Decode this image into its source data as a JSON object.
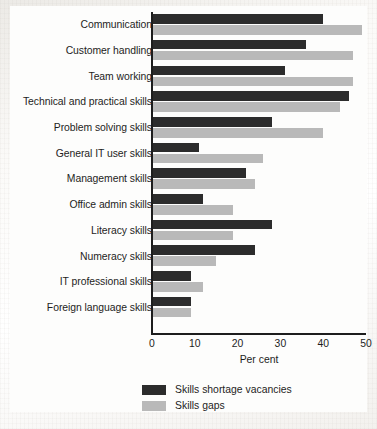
{
  "chart_data": {
    "type": "bar",
    "orientation": "horizontal",
    "title": "",
    "xlabel": "Per cent",
    "ylabel": "",
    "xlim": [
      0,
      50
    ],
    "xticks": [
      0,
      10,
      20,
      30,
      40,
      50
    ],
    "grid": false,
    "legend_position": "bottom",
    "categories": [
      "Communication",
      "Customer handling",
      "Team working",
      "Technical and practical skills",
      "Problem solving skills",
      "General IT user skills",
      "Management skills",
      "Office admin skills",
      "Literacy skills",
      "Numeracy skills",
      "IT professional skills",
      "Foreign language skills"
    ],
    "series": [
      {
        "name": "Skills shortage vacancies",
        "color": "#2c2c2c",
        "values": [
          40,
          36,
          31,
          46,
          28,
          11,
          22,
          12,
          28,
          24,
          9,
          9
        ]
      },
      {
        "name": "Skills gaps",
        "color": "#b9b9b9",
        "values": [
          49,
          47,
          47,
          44,
          40,
          26,
          24,
          19,
          19,
          15,
          12,
          9
        ]
      }
    ]
  },
  "axis": {
    "x_title": "Per cent",
    "tick_labels": [
      "0",
      "10",
      "20",
      "30",
      "40",
      "50"
    ]
  },
  "legend": {
    "items": [
      {
        "label": "Skills shortage vacancies",
        "color": "#2c2c2c"
      },
      {
        "label": "Skills gaps",
        "color": "#b9b9b9"
      }
    ]
  }
}
